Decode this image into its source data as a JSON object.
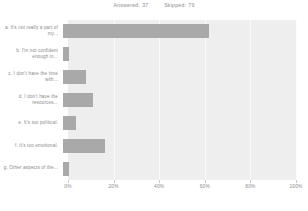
{
  "header": {
    "answered_label": "Answered:",
    "answered_value": "37",
    "skipped_label": "Skipped:",
    "skipped_value": "79"
  },
  "chart_data": {
    "type": "bar",
    "orientation": "horizontal",
    "title": "",
    "subtitle": "",
    "xlabel": "",
    "ylabel": "",
    "xlim": [
      0,
      100
    ],
    "xticks": [
      "0%",
      "20%",
      "40%",
      "60%",
      "80%",
      "100%"
    ],
    "xtick_values": [
      0,
      20,
      40,
      60,
      80,
      100
    ],
    "grid": true,
    "legend": false,
    "bar_color": "#a9a9a9",
    "plot_background": "#eeeeee",
    "categories": [
      "a. It's not really a part of my...",
      "b. I'm not confident enough in...",
      "c. I don't have the time with...",
      "d. I don't have the resources...",
      "e. It's too political.",
      "f. It's too emotional.",
      "g. Other aspects of the..."
    ],
    "values": [
      64,
      2.5,
      10,
      13,
      5.5,
      18.5,
      2.7
    ]
  }
}
